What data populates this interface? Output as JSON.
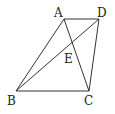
{
  "diagram": {
    "type": "geometry",
    "points": {
      "A": {
        "label": "A",
        "x": 64,
        "y": 19,
        "lx": 54,
        "ly": 17
      },
      "D": {
        "label": "D",
        "x": 99,
        "y": 19,
        "lx": 97,
        "ly": 17
      },
      "B": {
        "label": "B",
        "x": 16,
        "y": 91,
        "lx": 7,
        "ly": 105
      },
      "C": {
        "label": "C",
        "x": 89,
        "y": 91,
        "lx": 84,
        "ly": 105
      },
      "E": {
        "label": "E",
        "x": 72,
        "y": 45,
        "lx": 64,
        "ly": 63
      }
    },
    "segments": [
      [
        "A",
        "D"
      ],
      [
        "A",
        "B"
      ],
      [
        "A",
        "C"
      ],
      [
        "D",
        "B"
      ],
      [
        "D",
        "C"
      ],
      [
        "B",
        "C"
      ]
    ],
    "stroke_color": "#333333"
  }
}
